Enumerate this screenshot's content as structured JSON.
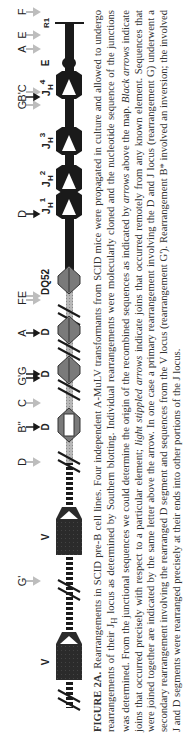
{
  "figure": {
    "id": "FIGURE 2A.",
    "orientation": "rotated 90 degrees counter-clockwise",
    "map": {
      "regions": [
        {
          "name": "V",
          "style": "large dark block"
        },
        {
          "name": "V",
          "style": "large dark block"
        },
        {
          "name": "D",
          "style": "light diamond (open)"
        },
        {
          "name": "D",
          "style": "gray diamond"
        },
        {
          "name": "D",
          "style": "gray diamond"
        },
        {
          "name": "DQ52",
          "style": "gray diamond"
        },
        {
          "name": "JH1",
          "style": "black block with white triangle"
        },
        {
          "name": "JH2",
          "style": "black block with white triangle"
        },
        {
          "name": "JH3",
          "style": "black block with white triangle"
        },
        {
          "name": "JH4",
          "style": "black block with white triangle"
        },
        {
          "name": "E",
          "style": "enhancer oval"
        },
        {
          "name": "R1",
          "style": "end tick"
        }
      ],
      "top_letters": [
        "G'",
        "D",
        "B\"",
        "C",
        "G'G",
        "A",
        "FE",
        "D",
        "G",
        "B'C",
        "A",
        "E",
        "F"
      ],
      "sub_labels": {
        "v1": "V",
        "v2": "V",
        "d1": "D",
        "d2": "D",
        "d3": "D",
        "dq52": "DQ52",
        "jh1": "J",
        "jh1_sub": "H",
        "jh1_sup": "1",
        "jh2": "J",
        "jh2_sub": "H",
        "jh2_sup": "2",
        "jh3": "J",
        "jh3_sub": "H",
        "jh3_sup": "3",
        "jh4": "J",
        "jh4_sub": "H",
        "jh4_sup": "4",
        "e": "E",
        "r1": "R1"
      },
      "labels": {
        "g_prime": "G'",
        "d_left": "D",
        "b_dprime": "B\"",
        "c": "C",
        "g_prime_g": "G'G",
        "a_left": "A",
        "fe": "FE",
        "d_mid": "D",
        "g": "G",
        "b_prime_c": "B'C",
        "a_right": "A",
        "e": "E",
        "f": "F"
      }
    },
    "caption": {
      "lead": "FIGURE 2A.",
      "part1": " Rearrangements in SCID pre-B cell lines. Four independent A-MuLV transformants from SCID mice were propagated in culture and allowed to undergo rearrangements of their J",
      "sub_h": "H",
      "part2": " locus as determined by Southern blotting. Individual rearrangements were molecularly cloned and the nucleotide sequence of the junctions was determined. From the junctional sequences we could determine the origin of the recombined sequences as indicated by ",
      "arrows_italic": "arrows",
      "part3": " above the map. ",
      "black_arrows_italic": "Black arrows",
      "part4": " indicate joins that occurred precisely with respect to a particular element; ",
      "light_arrows_italic": "light stippled arrows",
      "part5": " indicate joins that occurred remotely from any known element. Sequences that were joined together are indicated by the same letter above the arrow. In one case a primary rearrangement involving the D and J locus (rearrangement G) underwent a secondary rearrangement involving the rearranged D segment and sequences from the V locus (rearrangement G'). Rearrangement B* involved an inversion; the involved J and D segments were rearranged precisely at their ends into other portions of the J locus."
    },
    "colors": {
      "black_line": "#1a1a1a",
      "gray_line": "#9a9a9a",
      "v_block": "#2b2b2b",
      "diamond_gray": "#7a7a7a",
      "light_arrow": "#bdbdbd",
      "black_arrow": "#1a1a1a"
    }
  }
}
